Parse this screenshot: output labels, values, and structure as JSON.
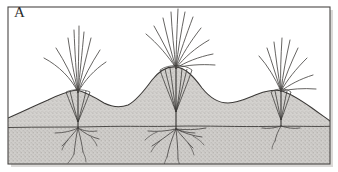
{
  "figure": {
    "panel_label": "A",
    "caption_text": "",
    "width_px": 338,
    "height_px": 172,
    "style": "scientific line drawing, stippled halftone soil fill"
  },
  "frame": {
    "border_color": "#4a4745",
    "border_width_px": 1,
    "background_color": "#ffffff",
    "shadow_color": "#bdbab6"
  },
  "colors": {
    "ink": "#3a3836",
    "soil_fill": "#d2d0cd",
    "soil_fill_deep": "#cbc9c6",
    "stipple_dot": "#9b9896",
    "ground_line": "#413f3d",
    "leaf_stroke": "#4a4846",
    "root_stroke": "#403e3c",
    "water_table_line": "#3d3b39"
  },
  "scene": {
    "name": "tussock-grass-hummock-profile",
    "description": "Three tussock grass plants on hummocks above a soil profile with a horizontal water table line and branching root systems",
    "ground_surface": {
      "name": "hummocky-ground-surface",
      "path": "M 8 118 C 22 112, 34 106, 48 100 C 58 95, 66 92, 76 90 C 86 92, 96 98, 104 103 C 112 107, 120 108, 128 105 C 136 101, 144 91, 152 80 C 160 70, 168 66, 176 67 C 186 68, 194 77, 202 88 C 210 98, 218 103, 228 103 C 238 103, 248 98, 258 94 C 266 91, 274 89, 282 91 C 292 94, 302 101, 312 108 C 320 114, 326 118, 330 121 L 330 164 L 8 164 Z"
    },
    "water_table": {
      "name": "water-table-line",
      "y_px": 126,
      "label": ""
    },
    "plants": [
      {
        "id": "plant-left",
        "name": "tussock-plant-left",
        "base_x": 78,
        "base_y": 92,
        "mound_peak_x": 78,
        "leaf_count": 9,
        "root_depth_px": 34,
        "root_branch_count": 7,
        "has_funnel_base": true
      },
      {
        "id": "plant-center",
        "name": "tussock-plant-center",
        "base_x": 176,
        "base_y": 68,
        "mound_peak_x": 176,
        "leaf_count": 11,
        "root_depth_px": 38,
        "root_branch_count": 9,
        "has_funnel_base": true
      },
      {
        "id": "plant-right",
        "name": "tussock-plant-right",
        "base_x": 281,
        "base_y": 91,
        "mound_peak_x": 281,
        "leaf_count": 9,
        "root_depth_px": 16,
        "root_branch_count": 3,
        "has_funnel_base": true
      }
    ]
  }
}
